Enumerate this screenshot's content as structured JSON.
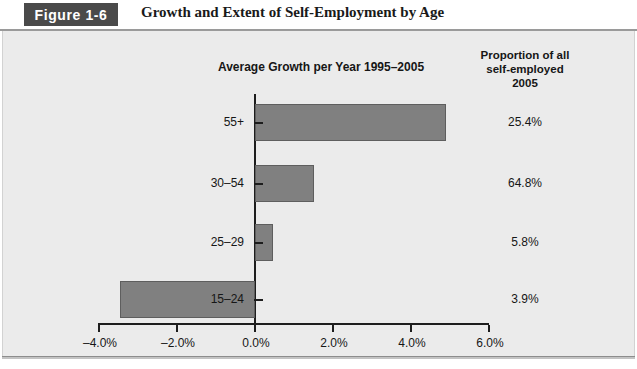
{
  "figure": {
    "number_label": "Figure 1-6",
    "title": "Growth and Extent of Self-Employment by Age"
  },
  "chart_title": "Average Growth per Year 1995–2005",
  "proportion_header": {
    "line1": "Proportion of all",
    "line2": "self-employed",
    "line3": "2005"
  },
  "colors": {
    "badge_background": "#4a4a4a",
    "badge_text": "#ffffff",
    "panel_background": "#ebebeb",
    "bar_fill": "#808080",
    "bar_stroke": "#5e5e5e",
    "axis": "#1d1d1d",
    "text": "#161616"
  },
  "chart_data": {
    "type": "bar",
    "orientation": "horizontal",
    "title": "Average Growth per Year 1995–2005",
    "xlabel": "",
    "ylabel": "",
    "categories": [
      "55+",
      "30–54",
      "25–29",
      "15–24"
    ],
    "values": [
      4.9,
      1.5,
      0.45,
      -3.45
    ],
    "xlim": [
      -4.0,
      6.0
    ],
    "xticks": [
      -4.0,
      -2.0,
      0.0,
      2.0,
      4.0,
      6.0
    ],
    "xtick_labels": [
      "–4.0%",
      "–2.0%",
      "0.0%",
      "2.0%",
      "4.0%",
      "6.0%"
    ],
    "grid": false,
    "legend": false,
    "series": [
      {
        "name": "Average growth per year 1995–2005 (%)",
        "values": [
          4.9,
          1.5,
          0.45,
          -3.45
        ]
      }
    ],
    "annotations": {
      "proportion_of_all_self_employed_2005": [
        "25.4%",
        "64.8%",
        "5.8%",
        "3.9%"
      ]
    }
  },
  "proportions": [
    "25.4%",
    "64.8%",
    "5.8%",
    "3.9%"
  ]
}
